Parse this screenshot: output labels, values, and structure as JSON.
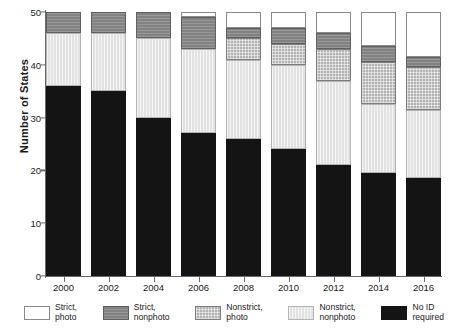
{
  "chart_data": {
    "type": "bar",
    "stacked": true,
    "title": "",
    "xlabel": "",
    "ylabel": "Number of States",
    "categories": [
      "2000",
      "2002",
      "2004",
      "2006",
      "2008",
      "2010",
      "2012",
      "2014",
      "2016"
    ],
    "ylim": [
      0,
      50
    ],
    "yticks": [
      0,
      10,
      20,
      30,
      40,
      50
    ],
    "grid": false,
    "legend_position": "bottom",
    "series": [
      {
        "name": "No ID required",
        "key": "no_id",
        "color": "#141414",
        "values": [
          36,
          35,
          30,
          27,
          26,
          24,
          21,
          19.5,
          18.5
        ]
      },
      {
        "name": "Nonstrict, nonphoto",
        "key": "nonstrict_nonphoto",
        "color": "#e2e2e2",
        "values": [
          10,
          11,
          15,
          16,
          15,
          16,
          16,
          13,
          13
        ]
      },
      {
        "name": "Nonstrict, photo",
        "key": "nonstrict_photo",
        "color": "#b3b3b3",
        "values": [
          0,
          0,
          0,
          0,
          4,
          4,
          6,
          8,
          8
        ]
      },
      {
        "name": "Strict, nonphoto",
        "key": "strict_nonphoto",
        "color": "#828282",
        "values": [
          4,
          4,
          5,
          6,
          2,
          3,
          3,
          3,
          2
        ]
      },
      {
        "name": "Strict, photo",
        "key": "strict_photo",
        "color": "#ffffff",
        "values": [
          0,
          0,
          0,
          1,
          3,
          3,
          4,
          6.5,
          8.5
        ]
      }
    ],
    "stack_order_bottom_to_top": [
      "no_id",
      "nonstrict_nonphoto",
      "nonstrict_photo",
      "strict_nonphoto",
      "strict_photo"
    ],
    "totals": [
      50,
      50,
      50,
      50,
      50,
      50,
      50,
      50,
      50
    ]
  },
  "axis": {
    "y_title": "Number of States",
    "y_ticks": [
      "0",
      "10",
      "20",
      "30",
      "40",
      "50"
    ],
    "x_ticks": [
      "2000",
      "2002",
      "2004",
      "2006",
      "2008",
      "2010",
      "2012",
      "2014",
      "2016"
    ]
  },
  "legend": {
    "items": [
      {
        "label": "Strict,\nphoto",
        "fill": "white"
      },
      {
        "label": "Strict,\nnonphoto",
        "fill": "dark"
      },
      {
        "label": "Nonstrict,\nphoto",
        "fill": "mid"
      },
      {
        "label": "Nonstrict,\nnonphoto",
        "fill": "light"
      },
      {
        "label": "No ID\nrequired",
        "fill": "black"
      }
    ]
  }
}
